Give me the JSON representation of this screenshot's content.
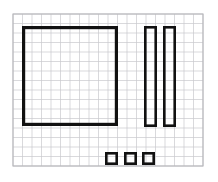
{
  "document": {
    "title": "Grid Paper Sketch",
    "medium": "graph-paper",
    "background_color": "#ffffff"
  },
  "grid": {
    "label": "graph paper grid",
    "line_color": "#c9c9cd",
    "border_color": "#b6b6bb",
    "cell_size_px": 9.6,
    "origin_x": 13,
    "origin_y": 14,
    "width_px": 190,
    "height_px": 152,
    "columns": 20,
    "rows": 16,
    "line_width_px": 0.7
  },
  "shapes": {
    "stroke_color": "#111111",
    "items": [
      {
        "name": "large-square",
        "type": "rectangle",
        "x": 22,
        "y": 26,
        "width": 96,
        "height": 100,
        "stroke_width": 3.2
      },
      {
        "name": "tall-bar-left",
        "type": "rectangle",
        "x": 144,
        "y": 26,
        "width": 13,
        "height": 101,
        "stroke_width": 2.6
      },
      {
        "name": "tall-bar-right",
        "type": "rectangle",
        "x": 163,
        "y": 26,
        "width": 13,
        "height": 101,
        "stroke_width": 2.6
      },
      {
        "name": "small-square-1",
        "type": "rectangle",
        "x": 105,
        "y": 152,
        "width": 13,
        "height": 13,
        "stroke_width": 2.6
      },
      {
        "name": "small-square-2",
        "type": "rectangle",
        "x": 124,
        "y": 152,
        "width": 13,
        "height": 13,
        "stroke_width": 2.6
      },
      {
        "name": "small-square-3",
        "type": "rectangle",
        "x": 142,
        "y": 152,
        "width": 13,
        "height": 13,
        "stroke_width": 2.6
      }
    ]
  }
}
